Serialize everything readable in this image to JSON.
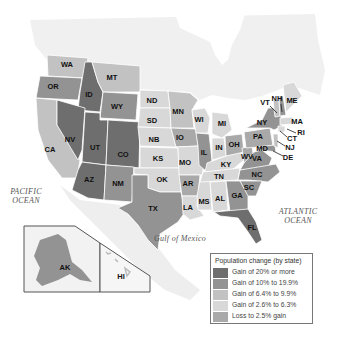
{
  "map": {
    "title": "Population change (by state)",
    "colors": {
      "gain_20_plus": "#6e6e6e",
      "gain_10_to_19_9": "#939393",
      "gain_6_4_to_9_9": "#c2c2c2",
      "gain_2_6_to_6_3": "#d8d8d8",
      "loss_to_2_5_gain": "#a9a9a9",
      "land": "#eeeeee",
      "water": "#ffffff",
      "border": "#ffffff"
    },
    "oceans": {
      "pacific": "PACIFIC\nOCEAN",
      "pacific_line1": "PACIFIC",
      "pacific_line2": "OCEAN",
      "atlantic_line1": "ATLANTIC",
      "atlantic_line2": "OCEAN",
      "gulf": "Gulf of Mexico"
    },
    "states": [
      {
        "abbr": "WA",
        "x": 67,
        "y": 65
      },
      {
        "abbr": "OR",
        "x": 53,
        "y": 87
      },
      {
        "abbr": "CA",
        "x": 50,
        "y": 150
      },
      {
        "abbr": "ID",
        "x": 89,
        "y": 95
      },
      {
        "abbr": "NV",
        "x": 70,
        "y": 140
      },
      {
        "abbr": "MT",
        "x": 112,
        "y": 78
      },
      {
        "abbr": "WY",
        "x": 117,
        "y": 107
      },
      {
        "abbr": "UT",
        "x": 95,
        "y": 148
      },
      {
        "abbr": "CO",
        "x": 123,
        "y": 155
      },
      {
        "abbr": "AZ",
        "x": 89,
        "y": 180
      },
      {
        "abbr": "NM",
        "x": 118,
        "y": 184
      },
      {
        "abbr": "ND",
        "x": 152,
        "y": 101
      },
      {
        "abbr": "SD",
        "x": 152,
        "y": 121
      },
      {
        "abbr": "NB",
        "x": 154,
        "y": 140
      },
      {
        "abbr": "KS",
        "x": 158,
        "y": 159
      },
      {
        "abbr": "OK",
        "x": 162,
        "y": 180
      },
      {
        "abbr": "TX",
        "x": 153,
        "y": 209
      },
      {
        "abbr": "MN",
        "x": 178,
        "y": 112
      },
      {
        "abbr": "IO",
        "x": 180,
        "y": 138
      },
      {
        "abbr": "MO",
        "x": 185,
        "y": 163
      },
      {
        "abbr": "AR",
        "x": 188,
        "y": 184
      },
      {
        "abbr": "LA",
        "x": 188,
        "y": 208
      },
      {
        "abbr": "WI",
        "x": 199,
        "y": 120
      },
      {
        "abbr": "IL",
        "x": 204,
        "y": 153
      },
      {
        "abbr": "MS",
        "x": 204,
        "y": 202
      },
      {
        "abbr": "MI",
        "x": 222,
        "y": 124
      },
      {
        "abbr": "IN",
        "x": 219,
        "y": 148
      },
      {
        "abbr": "KY",
        "x": 226,
        "y": 165
      },
      {
        "abbr": "TN",
        "x": 219,
        "y": 177
      },
      {
        "abbr": "AL",
        "x": 220,
        "y": 199
      },
      {
        "abbr": "OH",
        "x": 234,
        "y": 145
      },
      {
        "abbr": "WV",
        "x": 247,
        "y": 157
      },
      {
        "abbr": "VA",
        "x": 257,
        "y": 159
      },
      {
        "abbr": "NC",
        "x": 257,
        "y": 175
      },
      {
        "abbr": "SC",
        "x": 249,
        "y": 188
      },
      {
        "abbr": "GA",
        "x": 237,
        "y": 196
      },
      {
        "abbr": "FL",
        "x": 252,
        "y": 228
      },
      {
        "abbr": "PA",
        "x": 258,
        "y": 137
      },
      {
        "abbr": "NY",
        "x": 262,
        "y": 123
      },
      {
        "abbr": "MD",
        "x": 262,
        "y": 149
      },
      {
        "abbr": "DE",
        "x": 288,
        "y": 158
      },
      {
        "abbr": "NJ",
        "x": 290,
        "y": 148
      },
      {
        "abbr": "CT",
        "x": 292,
        "y": 139
      },
      {
        "abbr": "RI",
        "x": 301,
        "y": 133
      },
      {
        "abbr": "MA",
        "x": 297,
        "y": 122
      },
      {
        "abbr": "VT",
        "x": 265,
        "y": 103
      },
      {
        "abbr": "NH",
        "x": 277,
        "y": 99
      },
      {
        "abbr": "ME",
        "x": 292,
        "y": 101
      },
      {
        "abbr": "AK",
        "x": 65,
        "y": 268
      },
      {
        "abbr": "HI",
        "x": 121,
        "y": 277
      }
    ]
  },
  "legend": {
    "title": "Population change (by state)",
    "items": [
      {
        "label": "Gain of 20% or more",
        "color": "#6e6e6e"
      },
      {
        "label": "Gain of 10% to 19.9%",
        "color": "#939393"
      },
      {
        "label": "Gain of 6.4% to 9.9%",
        "color": "#c2c2c2"
      },
      {
        "label": "Gain of 2.6% to 6.3%",
        "color": "#d8d8d8"
      },
      {
        "label": "Loss to 2.5% gain",
        "color": "#a9a9a9"
      }
    ]
  }
}
